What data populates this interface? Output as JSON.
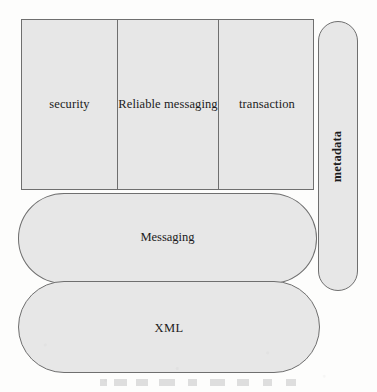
{
  "diagram": {
    "background_color": "#fdfdfc",
    "shape_fill_color": "#e7e7e7",
    "shape_border_color": "#6f6f6f",
    "text_color": "#1b1b1b",
    "top_band": {
      "shape": "rectangle",
      "cells": [
        {
          "label": "security"
        },
        {
          "label": "Reliable messaging"
        },
        {
          "label": "transaction"
        }
      ]
    },
    "side_tab": {
      "shape": "rounded-rectangle",
      "orientation": "vertical",
      "label": "metadata"
    },
    "layers": [
      {
        "shape": "rounded-rectangle",
        "label": "Messaging"
      },
      {
        "shape": "rounded-rectangle",
        "label": "XML"
      }
    ]
  }
}
